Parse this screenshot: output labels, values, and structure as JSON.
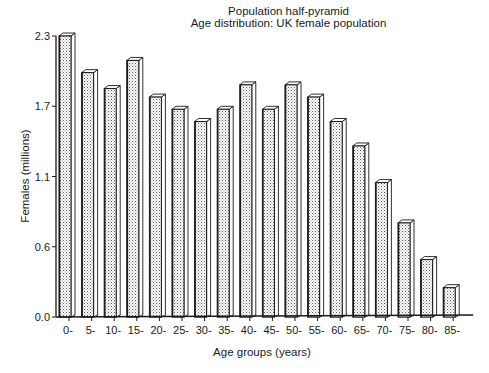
{
  "chart_data": {
    "type": "bar",
    "title": "Population half-pyramid",
    "subtitle": "Age distribution: UK female population",
    "xlabel": "Age groups (years)",
    "ylabel": "Females (millions)",
    "categories": [
      "0-",
      "5-",
      "10-",
      "15-",
      "20-",
      "25-",
      "30-",
      "35-",
      "40-",
      "45-",
      "50-",
      "55-",
      "60-",
      "65-",
      "70-",
      "75-",
      "80-",
      "85-"
    ],
    "values": [
      2.3,
      2.0,
      1.87,
      2.1,
      1.8,
      1.7,
      1.6,
      1.7,
      1.9,
      1.7,
      1.9,
      1.8,
      1.6,
      1.4,
      1.1,
      0.77,
      0.47,
      0.24
    ],
    "y_ticks": [
      "0.0",
      "0.6",
      "1.1",
      "1.7",
      "2.3"
    ],
    "ylim": [
      0,
      2.3
    ],
    "grid": false,
    "legend": null,
    "style": "3d-bars-stippled"
  },
  "colors": {
    "ink": "#1a1a1a",
    "bar_fill_dots": "#555555",
    "bar_side": "#ffffff",
    "background": "#ffffff"
  }
}
